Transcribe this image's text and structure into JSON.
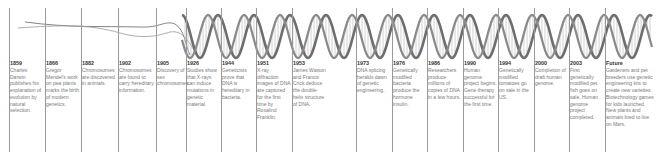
{
  "diagram": {
    "type": "timeline",
    "line_color": "#9a9a9a",
    "year_color": "#333333",
    "text_color": "#7a7a7a",
    "helix_color": "#6e6e6e"
  },
  "events": [
    {
      "year": "1859",
      "text": "Charles Darwin publishes his explanation of evolution by natural selection."
    },
    {
      "year": "1866",
      "text": "Gregor Mendel's work on pea plants marks the birth of modern genetics."
    },
    {
      "year": "1882",
      "text": "Chromosomes are discovered in animals."
    },
    {
      "year": "1902",
      "text": "Chromosomes are found to carry hereditary information."
    },
    {
      "year": "1905",
      "text": "Discovery of sex chromosomes."
    },
    {
      "year": "1926",
      "text": "Studies show that X-rays can induce mutations in genetic material."
    },
    {
      "year": "1944",
      "text": "Geneticists prove that DNA is hereditary in bacteria."
    },
    {
      "year": "1951",
      "text": "X-ray diffraction images of DNA are captured for the first time by Rosalind Franklin."
    },
    {
      "year": "1953",
      "text": "James Watson and Francis Crick deduce the double-helix structure of DNA."
    },
    {
      "year": "1973",
      "text": "DNA splicing heralds dawn of genetic engineering."
    },
    {
      "year": "1976",
      "text": "Genetically modified bacteria produce the hormone insulin."
    },
    {
      "year": "1986",
      "text": "Researchers produce millions of copies of DNA in a few hours."
    },
    {
      "year": "1990",
      "text": "Human genome project begins. Gene therapy successful for the first time."
    },
    {
      "year": "1994",
      "text": "Genetically modified tomatoes go on sale in the US."
    },
    {
      "year": "2000",
      "text": "Completion of draft human genome."
    },
    {
      "year": "2003",
      "text": "First genetically modified pet fish goes on sale. Human genome project completed."
    },
    {
      "year": "Future",
      "text": "Gardeners and pet breeders use genetic engineering kits to create new varieties. Biotechnology games for kids launched. New plants and animals bred to live on Mars."
    }
  ]
}
